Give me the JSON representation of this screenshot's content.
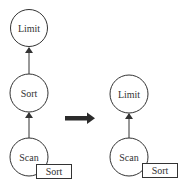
{
  "diagram": {
    "type": "query-plan-rewrite",
    "stroke_color": "#333333",
    "transform_arrow_color": "#2b2b2b",
    "before": {
      "nodes": [
        {
          "id": "limit",
          "label": "Limit"
        },
        {
          "id": "sort",
          "label": "Sort"
        },
        {
          "id": "scan",
          "label": "Scan",
          "annotation": "Sort"
        }
      ],
      "edges": [
        {
          "from": "scan",
          "to": "sort"
        },
        {
          "from": "sort",
          "to": "limit"
        }
      ]
    },
    "after": {
      "nodes": [
        {
          "id": "limit",
          "label": "Limit"
        },
        {
          "id": "scan",
          "label": "Scan",
          "annotation": "Sort"
        }
      ],
      "edges": [
        {
          "from": "scan",
          "to": "limit"
        }
      ]
    }
  }
}
